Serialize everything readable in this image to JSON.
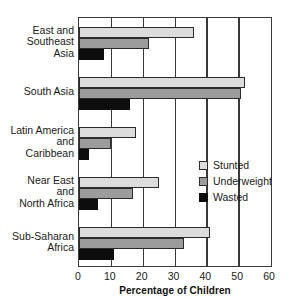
{
  "chart_data": {
    "type": "bar",
    "orientation": "horizontal",
    "title": "",
    "xlabel": "Percentage of Children",
    "ylabel": "",
    "xlim": [
      0,
      60
    ],
    "xticks": [
      0,
      10,
      20,
      30,
      40,
      50,
      60
    ],
    "grid": true,
    "legend_position": "center-right",
    "categories": [
      "East and\nSoutheast\nAsia",
      "South Asia",
      "Latin America\nand\nCaribbean",
      "Near East\nand\nNorth Africa",
      "Sub-Saharan\nAfrica"
    ],
    "series": [
      {
        "name": "Stunted",
        "color": "#dcdcdc",
        "values": [
          36,
          52,
          18,
          25,
          41
        ]
      },
      {
        "name": "Underweight",
        "color": "#9c9c9c",
        "values": [
          22,
          51,
          10,
          17,
          33
        ]
      },
      {
        "name": "Wasted",
        "color": "#0d0d0d",
        "values": [
          8,
          16,
          3,
          6,
          11
        ]
      }
    ]
  },
  "axis": {
    "x_title": "Percentage of Children",
    "tick_labels": [
      "0",
      "10",
      "20",
      "30",
      "40",
      "50",
      "60"
    ]
  },
  "categories": [
    {
      "lines": [
        "East and",
        "Southeast",
        "Asia"
      ]
    },
    {
      "lines": [
        "South Asia"
      ]
    },
    {
      "lines": [
        "Latin America",
        "and",
        "Caribbean"
      ]
    },
    {
      "lines": [
        "Near East",
        "and",
        "North Africa"
      ]
    },
    {
      "lines": [
        "Sub-Saharan",
        "Africa"
      ]
    }
  ],
  "legend": {
    "items": [
      {
        "label": "Stunted",
        "color": "#dcdcdc"
      },
      {
        "label": "Underweight",
        "color": "#9c9c9c"
      },
      {
        "label": "Wasted",
        "color": "#0d0d0d"
      }
    ]
  }
}
